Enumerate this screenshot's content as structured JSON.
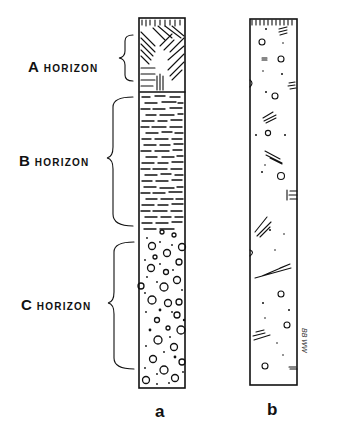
{
  "figure": {
    "horizons": [
      {
        "letter": "A",
        "word": "HORIZON"
      },
      {
        "letter": "B",
        "word": "HORIZON"
      },
      {
        "letter": "C",
        "word": "HORIZON"
      }
    ],
    "columns": [
      {
        "caption": "a"
      },
      {
        "caption": "b"
      }
    ],
    "signature": "BB WW"
  }
}
